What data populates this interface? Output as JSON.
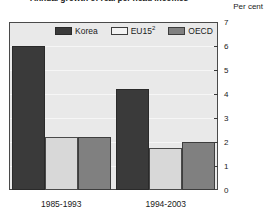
{
  "figure": {
    "title": "Annual growth of real per head incomes",
    "axis_unit": "Per cent"
  },
  "legend": {
    "position": "top-inside",
    "items": [
      {
        "label": "Korea",
        "sup": "",
        "color": "#3a3a3a",
        "swatch": "legend-swatch-korea"
      },
      {
        "label": "EU15",
        "sup": "2",
        "color": "#f2f2f2",
        "swatch": "legend-swatch-eu15"
      },
      {
        "label": "OECD",
        "sup": "",
        "color": "#808080",
        "swatch": "legend-swatch-oecd"
      }
    ]
  },
  "chart_data": {
    "type": "bar",
    "title": "Annual growth of real per head incomes",
    "xlabel": "",
    "ylabel": "Per cent",
    "ylim": [
      0,
      7
    ],
    "yticks": [
      0,
      1,
      2,
      3,
      4,
      5,
      6,
      7
    ],
    "ytick_labels": [
      "0",
      "1",
      "2",
      "3",
      "4",
      "5",
      "6",
      "7"
    ],
    "grid": true,
    "legend_position": "top-inside",
    "categories": [
      "1985-1993",
      "1994-2003"
    ],
    "series": [
      {
        "name": "Korea",
        "color": "#3a3a3a",
        "values": [
          6.0,
          4.2
        ]
      },
      {
        "name": "EU15",
        "color": "#f2f2f2",
        "values": [
          2.2,
          1.75
        ]
      },
      {
        "name": "OECD",
        "color": "#808080",
        "values": [
          2.2,
          2.0
        ]
      }
    ]
  }
}
